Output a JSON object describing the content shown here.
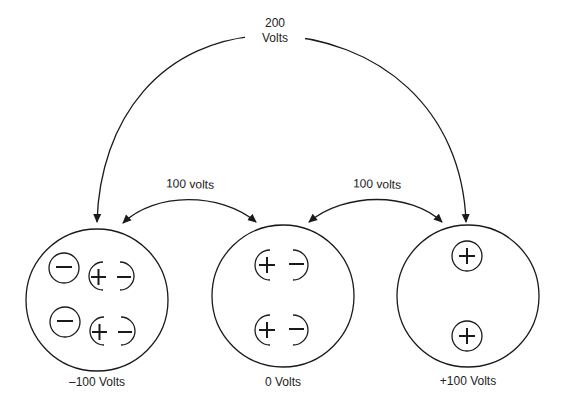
{
  "diagram": {
    "top_label": {
      "line1": "200",
      "line2": "Volts"
    },
    "left_arc_label": "100 volts",
    "right_arc_label": "100 volts",
    "plates": [
      {
        "caption": "–100 Volts",
        "charges": [
          "free-negative",
          "dipole",
          "free-negative",
          "dipole"
        ]
      },
      {
        "caption": "0 Volts",
        "charges": [
          "dipole",
          "dipole"
        ]
      },
      {
        "caption": "+100 Volts",
        "charges": [
          "free-positive",
          "free-positive"
        ]
      }
    ],
    "symbols": {
      "plus": "+",
      "minus": "−"
    },
    "colors": {
      "stroke": "#1a1a1a",
      "background": "#ffffff"
    }
  }
}
